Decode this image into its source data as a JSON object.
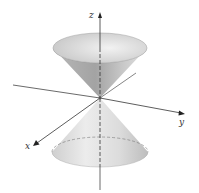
{
  "diagram": {
    "axes": {
      "x": {
        "label": "x"
      },
      "y": {
        "label": "y"
      },
      "z": {
        "label": "z"
      }
    },
    "colors": {
      "cone_light": "#e6e6e6",
      "cone_dark": "#9a9a9a",
      "axis": "#333333"
    }
  }
}
